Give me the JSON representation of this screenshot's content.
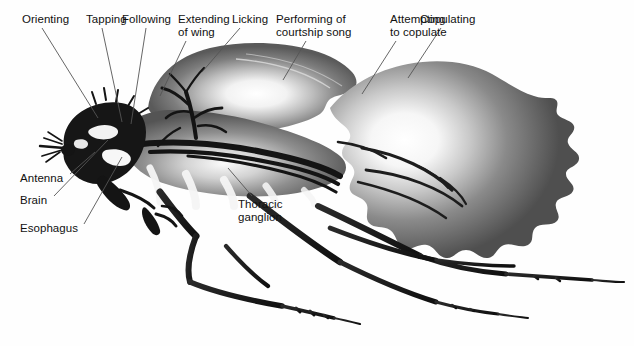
{
  "figure": {
    "background_color": "#ffffff",
    "text_color": "#111111",
    "width": 634,
    "height": 346
  },
  "behavior_labels": [
    {
      "id": "orienting",
      "text": "Orienting",
      "x": 22,
      "y": 13,
      "align": "left",
      "leader": {
        "x1": 42,
        "y1": 28,
        "x2": 98,
        "y2": 118
      }
    },
    {
      "id": "tapping",
      "text": "Tapping",
      "x": 86,
      "y": 13,
      "align": "left",
      "leader": {
        "x1": 102,
        "y1": 28,
        "x2": 122,
        "y2": 122
      }
    },
    {
      "id": "following",
      "text": "Following",
      "x": 122,
      "y": 13,
      "align": "left",
      "leader": {
        "x1": 146,
        "y1": 28,
        "x2": 131,
        "y2": 124
      }
    },
    {
      "id": "extending-of-wing",
      "text": "Extending\nof wing",
      "x": 178,
      "y": 13,
      "align": "left",
      "leader": {
        "x1": 186,
        "y1": 41,
        "x2": 160,
        "y2": 96
      }
    },
    {
      "id": "licking",
      "text": "Licking",
      "x": 232,
      "y": 13,
      "align": "left",
      "leader": {
        "x1": 240,
        "y1": 28,
        "x2": 202,
        "y2": 72
      }
    },
    {
      "id": "performing-song",
      "text": "Performing of\ncourtship song",
      "x": 276,
      "y": 13,
      "align": "left",
      "leader": {
        "x1": 306,
        "y1": 41,
        "x2": 283,
        "y2": 80
      }
    },
    {
      "id": "attempting-copulate",
      "text": "Attempting\nto copulate",
      "x": 390,
      "y": 13,
      "align": "left",
      "leader": {
        "x1": 396,
        "y1": 41,
        "x2": 362,
        "y2": 94
      }
    },
    {
      "id": "copulating",
      "text": "Copulating",
      "x": 420,
      "y": 13,
      "align": "left",
      "leader": {
        "x1": 441,
        "y1": 28,
        "x2": 408,
        "y2": 78
      }
    }
  ],
  "anatomy_labels": [
    {
      "id": "antenna",
      "text": "Antenna",
      "x": 20,
      "y": 172,
      "align": "left",
      "leader": {
        "x1": 70,
        "y1": 174,
        "x2": 95,
        "y2": 152
      }
    },
    {
      "id": "brain",
      "text": "Brain",
      "x": 20,
      "y": 194,
      "align": "left",
      "leader": {
        "x1": 54,
        "y1": 196,
        "x2": 108,
        "y2": 140
      }
    },
    {
      "id": "esophagus",
      "text": "Esophagus",
      "x": 20,
      "y": 222,
      "align": "left",
      "leader": {
        "x1": 84,
        "y1": 224,
        "x2": 122,
        "y2": 157
      }
    },
    {
      "id": "thoracic-ganglion",
      "text": "Thoracic\nganglion",
      "x": 238,
      "y": 198,
      "align": "left",
      "leader": {
        "x1": 252,
        "y1": 196,
        "x2": 228,
        "y2": 168
      }
    }
  ],
  "palette": {
    "ink_black": "#1a1a1a",
    "body_dark": "#4a4a4a",
    "body_mid": "#6e6e6e",
    "body_light": "#b5b5b5",
    "highlight": "#ffffff",
    "leader_line": "#555555"
  }
}
